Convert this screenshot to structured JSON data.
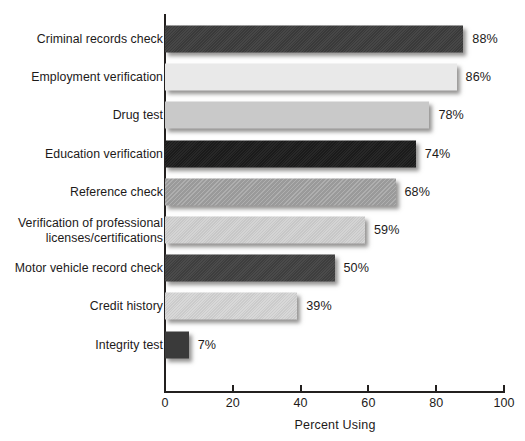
{
  "chart_data": {
    "type": "bar",
    "orientation": "horizontal",
    "title": "",
    "xlabel": "Percent Using",
    "ylabel": "",
    "xlim": [
      0,
      100
    ],
    "xticks": [
      0,
      20,
      40,
      60,
      80,
      100
    ],
    "xtick_labels": [
      "0",
      "20",
      "40",
      "60",
      "80",
      "100"
    ],
    "grid": false,
    "legend": null,
    "value_label_suffix": "%",
    "categories": [
      "Criminal records check",
      "Employment verification",
      "Drug test",
      "Education verification",
      "Reference check",
      "Verification of professional\nlicenses/certifications",
      "Motor vehicle record check",
      "Credit history",
      "Integrity test"
    ],
    "values": [
      88,
      86,
      78,
      74,
      68,
      59,
      50,
      39,
      7
    ],
    "value_labels": [
      "88%",
      "86%",
      "78%",
      "74%",
      "68%",
      "59%",
      "50%",
      "39%",
      "7%"
    ],
    "bar_colors": [
      "#3d3d3d",
      "#e9e9e9",
      "#c9c9c9",
      "#1c1c1c",
      "#a3a3a3",
      "#d2d2d2",
      "#414141",
      "#d6d6d6",
      "#3a3a3a"
    ],
    "bar_textures": [
      "grain",
      "plain",
      "plain",
      "grain",
      "hatch",
      "grain",
      "grain",
      "grain",
      "plain"
    ],
    "bars": [
      {
        "category": "Criminal records check",
        "value": 88,
        "label": "88%",
        "color": "#3d3d3d",
        "texture": "grain"
      },
      {
        "category": "Employment verification",
        "value": 86,
        "label": "86%",
        "color": "#e9e9e9",
        "texture": "plain"
      },
      {
        "category": "Drug test",
        "value": 78,
        "label": "78%",
        "color": "#c9c9c9",
        "texture": "plain"
      },
      {
        "category": "Education verification",
        "value": 74,
        "label": "74%",
        "color": "#1c1c1c",
        "texture": "grain"
      },
      {
        "category": "Reference check",
        "value": 68,
        "label": "68%",
        "color": "#a3a3a3",
        "texture": "hatch"
      },
      {
        "category": "Verification of professional\nlicenses/certifications",
        "value": 59,
        "label": "59%",
        "color": "#d2d2d2",
        "texture": "grain"
      },
      {
        "category": "Motor vehicle record check",
        "value": 50,
        "label": "50%",
        "color": "#414141",
        "texture": "grain"
      },
      {
        "category": "Credit history",
        "value": 39,
        "label": "39%",
        "color": "#d6d6d6",
        "texture": "grain"
      },
      {
        "category": "Integrity test",
        "value": 7,
        "label": "7%",
        "color": "#3a3a3a",
        "texture": "plain"
      }
    ],
    "colors": {
      "background": "#ffffff",
      "axis": "#23201f",
      "text": "#1d1a19"
    }
  }
}
